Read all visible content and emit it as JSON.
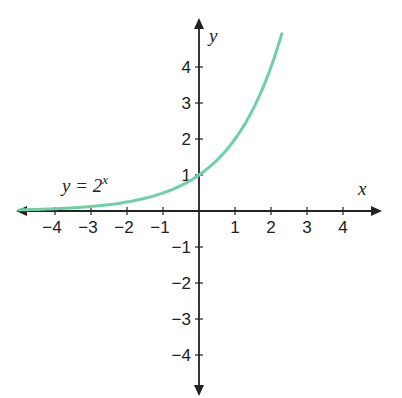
{
  "chart_data": {
    "type": "line",
    "title": "",
    "xlabel": "x",
    "ylabel": "y",
    "xlim": [
      -5,
      5
    ],
    "ylim": [
      -5,
      5
    ],
    "x_ticks": [
      "-4",
      "-3",
      "-2",
      "-1",
      "1",
      "2",
      "3",
      "4"
    ],
    "y_ticks": [
      "4",
      "3",
      "2",
      "1",
      "-1",
      "-2",
      "-3",
      "-4"
    ],
    "series": [
      {
        "name": "y = 2^x",
        "color": "#6fcfa9",
        "x": [
          -5,
          -4,
          -3,
          -2,
          -1,
          0,
          1,
          2,
          2.3
        ],
        "y": [
          0.03125,
          0.0625,
          0.125,
          0.25,
          0.5,
          1,
          2,
          4,
          4.92
        ]
      }
    ],
    "annotations": [
      {
        "text": "y = 2",
        "sup": "x",
        "x": -3.8,
        "y": 0.5
      }
    ],
    "grid": false,
    "legend": "none"
  },
  "labels": {
    "x_axis": "x",
    "y_axis": "y",
    "curve_label_base": "y = 2",
    "curve_label_exp": "x"
  }
}
